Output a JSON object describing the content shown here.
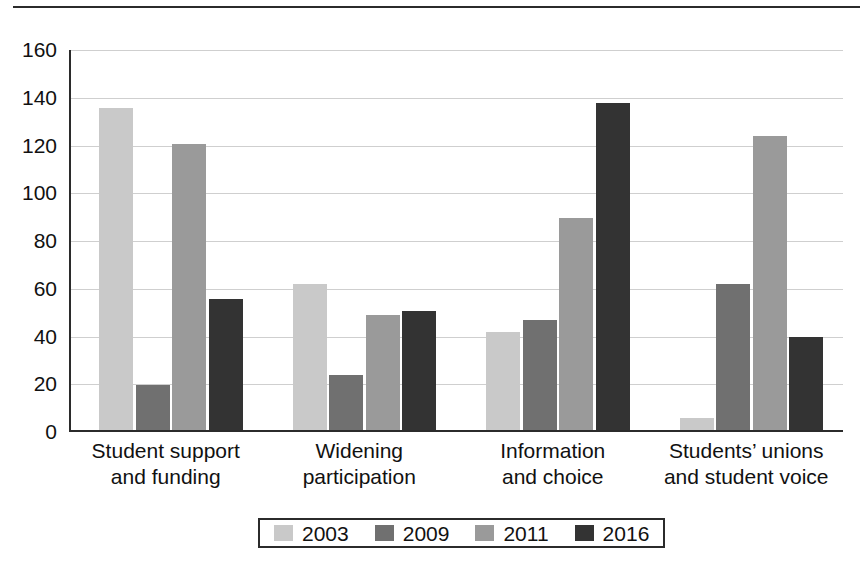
{
  "chart_data": {
    "type": "bar",
    "title": "",
    "subtitle": "",
    "xlabel": "",
    "ylabel": "",
    "ylim": [
      0,
      160
    ],
    "ytick_step": 20,
    "yticks": [
      160,
      140,
      120,
      100,
      80,
      60,
      40,
      20,
      0
    ],
    "grid": true,
    "legend_position": "bottom",
    "categories": [
      "Student support\nand funding",
      "Widening\nparticipation",
      "Information\nand choice",
      "Students’ unions\nand student voice"
    ],
    "category_lines": [
      [
        "Student support",
        "and funding"
      ],
      [
        "Widening",
        "participation"
      ],
      [
        "Information",
        "and choice"
      ],
      [
        "Students’ unions",
        "and student voice"
      ]
    ],
    "series": [
      {
        "name": "2003",
        "color": "#c9c9c9",
        "values": [
          135,
          61,
          41,
          5
        ]
      },
      {
        "name": "2009",
        "color": "#707070",
        "values": [
          19,
          23,
          46,
          61
        ]
      },
      {
        "name": "2011",
        "color": "#9a9a9a",
        "values": [
          120,
          48,
          89,
          123
        ]
      },
      {
        "name": "2016",
        "color": "#333333",
        "values": [
          55,
          50,
          137,
          39
        ]
      }
    ]
  },
  "legend": {
    "entries": [
      {
        "label": "2003",
        "color": "#c9c9c9"
      },
      {
        "label": "2009",
        "color": "#707070"
      },
      {
        "label": "2011",
        "color": "#9a9a9a"
      },
      {
        "label": "2016",
        "color": "#333333"
      }
    ]
  },
  "colors": {
    "axis": "#2b2b2b",
    "grid": "#cfcfcf",
    "text": "#111111",
    "background": "#ffffff"
  }
}
